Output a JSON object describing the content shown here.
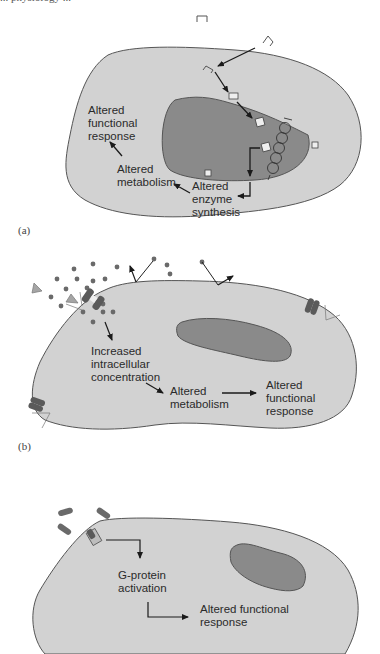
{
  "figure": {
    "running_header": "... physiology ...",
    "colors": {
      "cytoplasm": "#d2d2d2",
      "nucleus": "#8a8a8a",
      "outline": "#555555",
      "arrow": "#1a1a1a",
      "ion": "#6a6a6a",
      "channel": "#5a5a5a",
      "triangle": "#a5a5a5"
    },
    "panels": [
      {
        "id": "a",
        "label": "(a)",
        "description": "Lipophilic hormone enters cell, binds intracellular receptor, moves into nucleus, alters gene expression",
        "texts": {
          "functional": "Altered\nfunctional\nresponse",
          "metabolism": "Altered\nmetabolism",
          "enzyme": "Altered\nenzyme\nsynthesis"
        }
      },
      {
        "id": "b",
        "label": "(b)",
        "description": "Ligand-gated ion channel opens, ions flow into cell",
        "texts": {
          "concentration": "Increased\nintracellular\nconcentration",
          "metabolism": "Altered\nmetabolism",
          "functional": "Altered\nfunctional\nresponse"
        }
      },
      {
        "id": "c",
        "label": "",
        "description": "Ligand binds G-protein coupled receptor",
        "texts": {
          "gprotein": "G-protein\nactivation",
          "functional": "Altered functional\nresponse"
        }
      }
    ]
  }
}
